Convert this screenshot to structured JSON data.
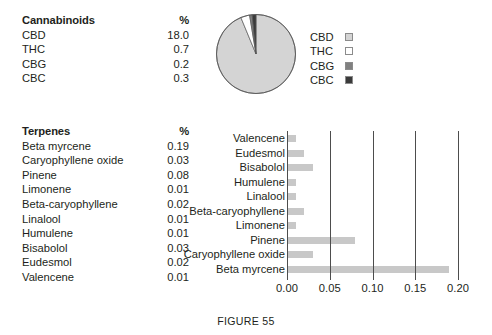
{
  "caption": "FIGURE 55",
  "cannabinoid_table": {
    "header": {
      "name": "Cannabinoids",
      "value": "%"
    },
    "rows": [
      {
        "name": "CBD",
        "value": "18.0"
      },
      {
        "name": "THC",
        "value": "0.7"
      },
      {
        "name": "CBG",
        "value": "0.2"
      },
      {
        "name": "CBC",
        "value": "0.3"
      }
    ]
  },
  "terpene_table": {
    "header": {
      "name": "Terpenes",
      "value": "%"
    },
    "rows": [
      {
        "name": "Beta myrcene",
        "value": "0.19"
      },
      {
        "name": "Caryophyllene oxide",
        "value": "0.03"
      },
      {
        "name": "Pinene",
        "value": "0.08"
      },
      {
        "name": "Limonene",
        "value": "0.01"
      },
      {
        "name": "Beta-caryophyllene",
        "value": "0.02"
      },
      {
        "name": "Linalool",
        "value": "0.01"
      },
      {
        "name": "Humulene",
        "value": "0.01"
      },
      {
        "name": "Bisabolol",
        "value": "0.03"
      },
      {
        "name": "Eudesmol",
        "value": "0.02"
      },
      {
        "name": "Valencene",
        "value": "0.01"
      }
    ]
  },
  "pie_legend": {
    "items": [
      {
        "label": "CBD",
        "color": "#d4d4d4"
      },
      {
        "label": "THC",
        "color": "#ffffff"
      },
      {
        "label": "CBG",
        "color": "#808080"
      },
      {
        "label": "CBC",
        "color": "#3a3a3a"
      }
    ]
  },
  "chart_data": [
    {
      "type": "pie",
      "title": "",
      "categories": [
        "CBD",
        "THC",
        "CBG",
        "CBC"
      ],
      "values": [
        18.0,
        0.7,
        0.2,
        0.3
      ],
      "unit": "%",
      "colors": [
        "#d4d4d4",
        "#ffffff",
        "#808080",
        "#3a3a3a"
      ],
      "legend_position": "right",
      "start_angle_deg": 0,
      "direction": "clockwise"
    },
    {
      "type": "bar",
      "orientation": "horizontal",
      "title": "",
      "xlabel": "",
      "ylabel": "",
      "xlim": [
        0.0,
        0.2
      ],
      "xticks": [
        0.0,
        0.05,
        0.1,
        0.15,
        0.2
      ],
      "xticklabels": [
        "0.00",
        "0.05",
        "0.10",
        "0.15",
        "0.20"
      ],
      "grid": true,
      "bar_color": "#c8c8c8",
      "categories": [
        "Valencene",
        "Eudesmol",
        "Bisabolol",
        "Humulene",
        "Linalool",
        "Beta-caryophyllene",
        "Limonene",
        "Pinene",
        "Caryophyllene oxide",
        "Beta myrcene"
      ],
      "values": [
        0.01,
        0.02,
        0.03,
        0.01,
        0.01,
        0.02,
        0.01,
        0.08,
        0.03,
        0.19
      ]
    }
  ]
}
